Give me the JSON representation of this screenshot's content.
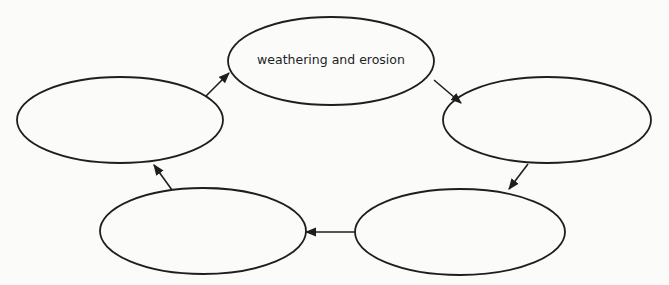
{
  "diagram": {
    "type": "cycle",
    "title": "",
    "nodes": [
      {
        "id": "top",
        "label": "weathering and erosion"
      },
      {
        "id": "right",
        "label": ""
      },
      {
        "id": "bottom-right",
        "label": ""
      },
      {
        "id": "bottom-left",
        "label": ""
      },
      {
        "id": "left",
        "label": ""
      }
    ],
    "edges": [
      {
        "from": "left",
        "to": "top"
      },
      {
        "from": "top",
        "to": "right"
      },
      {
        "from": "right",
        "to": "bottom-right"
      },
      {
        "from": "bottom-right",
        "to": "bottom-left"
      },
      {
        "from": "bottom-left",
        "to": "left"
      }
    ],
    "colors": {
      "stroke": "#1e1e1e",
      "background": "#fbfbfa"
    }
  }
}
